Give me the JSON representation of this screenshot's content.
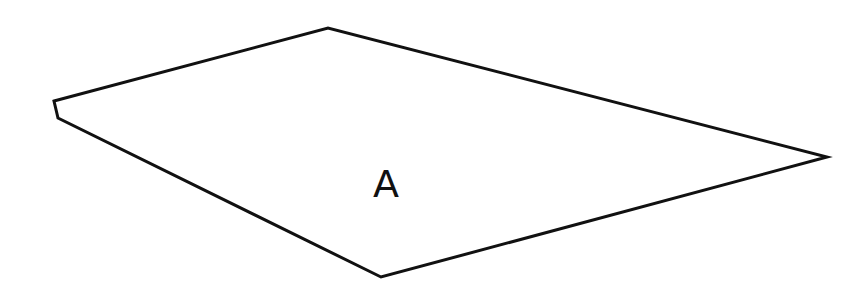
{
  "diagram": {
    "type": "plane-quadrilateral",
    "region_label": "A",
    "stroke_color": "#111111",
    "background_color": "#ffffff",
    "outline_points": "54,101 328,28 827,157 381,277 58,118",
    "label_position": {
      "x": 373,
      "y": 165,
      "font_size": 38
    }
  }
}
